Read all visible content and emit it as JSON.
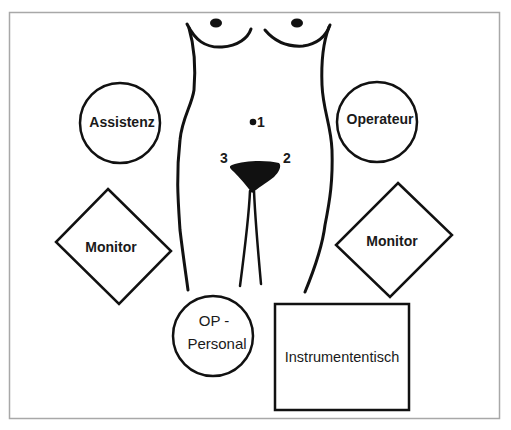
{
  "diagram": {
    "type": "operating-room-layout",
    "frame": {
      "x": 9,
      "y": 12,
      "width": 491,
      "height": 407,
      "color": "#a8a8a8"
    },
    "stroke_color": "#111111",
    "patient": {
      "markers": [
        {
          "id": "1",
          "label": "1",
          "type": "dot",
          "x": 253,
          "y": 122
        },
        {
          "id": "2",
          "label": "2",
          "x": 287,
          "y": 157
        },
        {
          "id": "3",
          "label": "3",
          "x": 224,
          "y": 157
        }
      ]
    },
    "stations": [
      {
        "id": "assistenz",
        "label": "Assistenz",
        "shape": "circle",
        "cx": 120,
        "cy": 123,
        "r": 41
      },
      {
        "id": "operateur",
        "label": "Operateur",
        "shape": "circle",
        "cx": 377,
        "cy": 122,
        "r": 41
      },
      {
        "id": "monitor-left",
        "label": "Monitor",
        "shape": "diamond"
      },
      {
        "id": "monitor-right",
        "label": "Monitor",
        "shape": "diamond"
      },
      {
        "id": "op-personal",
        "label_line1": "OP -",
        "label_line2": "Personal",
        "shape": "circle",
        "cx": 213,
        "cy": 336,
        "r": 41
      },
      {
        "id": "instrumententisch",
        "label": "Instrumententisch",
        "shape": "rectangle",
        "x": 274,
        "y": 304,
        "width": 136,
        "height": 106
      }
    ]
  }
}
